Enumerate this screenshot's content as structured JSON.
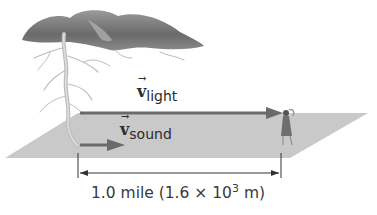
{
  "diagram": {
    "labels": {
      "light_symbol": "v",
      "light_subscript": "light",
      "sound_symbol": "v",
      "sound_subscript": "sound"
    },
    "distance": {
      "prefix": "1.0 mile (1.6 × 10",
      "exponent": "3",
      "suffix": " m)"
    },
    "elements": [
      "storm-cloud",
      "lightning-bolt",
      "ground-plane",
      "observer-figure",
      "light-velocity-arrow",
      "sound-velocity-arrow",
      "distance-dimension-line"
    ],
    "colors": {
      "cloud": "#6e6e6e",
      "ground": "#c9c9c9",
      "arrow": "#6a6a6a",
      "lightning": "#bdbdbd",
      "text": "#2b2b2b"
    }
  }
}
